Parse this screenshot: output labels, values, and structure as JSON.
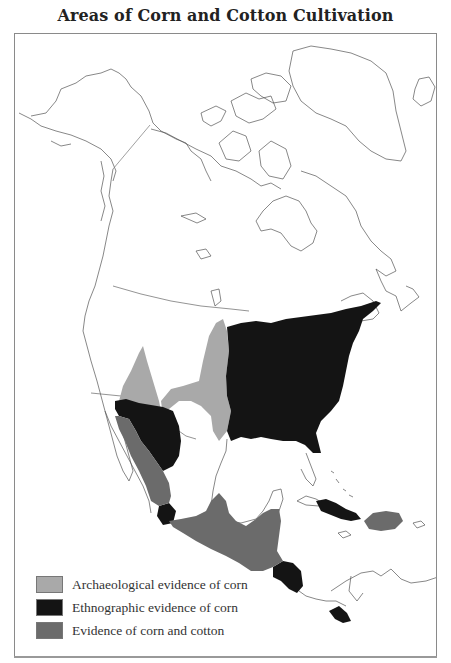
{
  "title": "Areas of Corn and Cotton Cultivation",
  "colors": {
    "archaeological": "#a9a9a9",
    "ethnographic": "#141414",
    "corn_and_cotton": "#6b6b6b",
    "coastline": "#555555",
    "frame": "#8a8a8a"
  },
  "legend": {
    "items": [
      {
        "label": "Archaeological evidence of corn",
        "color": "#a9a9a9"
      },
      {
        "label": "Ethnographic evidence of corn",
        "color": "#141414"
      },
      {
        "label": "Evidence of corn and cotton",
        "color": "#6b6b6b"
      }
    ]
  },
  "regions": [
    {
      "name": "Eastern North America",
      "category": "Ethnographic evidence of corn"
    },
    {
      "name": "Great Plains",
      "category": "Archaeological evidence of corn"
    },
    {
      "name": "Great Basin / Colorado Plateau",
      "category": "Archaeological evidence of corn"
    },
    {
      "name": "Southwest (Pueblo)",
      "category": "Ethnographic evidence of corn"
    },
    {
      "name": "Northwest Mexico",
      "category": "Evidence of corn and cotton"
    },
    {
      "name": "Mesoamerica",
      "category": "Evidence of corn and cotton"
    },
    {
      "name": "West Mexico pocket",
      "category": "Ethnographic evidence of corn"
    },
    {
      "name": "Honduras / Nicaragua",
      "category": "Ethnographic evidence of corn"
    },
    {
      "name": "Panama",
      "category": "Ethnographic evidence of corn"
    },
    {
      "name": "Cuba",
      "category": "Ethnographic evidence of corn"
    },
    {
      "name": "Hispaniola",
      "category": "Evidence of corn and cotton"
    }
  ]
}
